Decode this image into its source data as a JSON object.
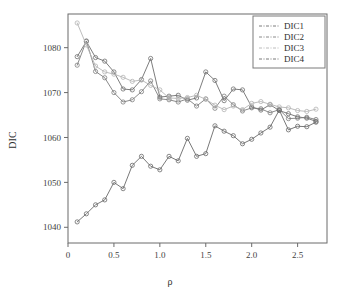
{
  "figure": {
    "background_color": "#ffffff",
    "frame_color": "#6b6b6b"
  },
  "chart_data": {
    "type": "line",
    "title": "",
    "xlabel": "ρ",
    "ylabel": "DIC",
    "xlim": [
      0.0,
      2.82
    ],
    "ylim": [
      1036.5,
      1087.5
    ],
    "xticks": [
      0,
      0.5,
      1.0,
      1.5,
      2.0,
      2.5
    ],
    "xtick_labels": [
      "0",
      "0.5",
      "1.0",
      "1.5",
      "2.0",
      "2.5"
    ],
    "yticks": [
      1040,
      1050,
      1060,
      1070,
      1080
    ],
    "ytick_labels": [
      "1040",
      "1050",
      "1060",
      "1070",
      "1080"
    ],
    "grid": false,
    "legend_position": "top-right",
    "marker": "circle-open",
    "x": [
      0.1,
      0.2,
      0.3,
      0.4,
      0.5,
      0.6,
      0.7,
      0.8,
      0.9,
      1.0,
      1.1,
      1.2,
      1.3,
      1.4,
      1.5,
      1.6,
      1.7,
      1.8,
      1.9,
      2.0,
      2.1,
      2.2,
      2.3,
      2.4,
      2.5,
      2.6,
      2.7
    ],
    "series": [
      {
        "name": "DIC1",
        "color": "#6e6e6e",
        "values": [
          1078.0,
          1081.4,
          1077.8,
          1077.0,
          1074.6,
          1070.8,
          1070.6,
          1072.9,
          1077.6,
          1069.0,
          1069.2,
          1069.4,
          1068.3,
          1068.8,
          1074.6,
          1072.7,
          1068.2,
          1070.8,
          1070.6,
          1066.8,
          1066.1,
          1067.3,
          1066.0,
          1065.3,
          1064.6,
          1064.3,
          1063.6
        ]
      },
      {
        "name": "DIC2",
        "color": "#7d7d7d",
        "values": [
          1076.1,
          1081.5,
          1074.7,
          1073.3,
          1070.0,
          1067.9,
          1068.4,
          1070.2,
          1072.6,
          1068.6,
          1068.4,
          1067.9,
          1068.6,
          1067.0,
          1068.6,
          1066.5,
          1069.2,
          1067.3,
          1065.9,
          1066.6,
          1066.4,
          1065.5,
          1066.2,
          1064.2,
          1064.3,
          1064.5,
          1064.0
        ]
      },
      {
        "name": "DIC3",
        "color": "#b4b4b4",
        "values": [
          1085.5,
          1080.6,
          1075.9,
          1074.6,
          1074.1,
          1073.4,
          1072.5,
          1072.8,
          1071.6,
          1070.6,
          1068.8,
          1068.7,
          1068.9,
          1069.4,
          1068.5,
          1067.2,
          1066.2,
          1067.0,
          1066.2,
          1067.6,
          1068.0,
          1067.4,
          1066.8,
          1066.6,
          1066.0,
          1065.8,
          1066.3
        ]
      },
      {
        "name": "DIC4",
        "color": "#6a6a6a",
        "values": [
          1041.2,
          1043.0,
          1045.0,
          1046.1,
          1050.0,
          1048.6,
          1053.8,
          1055.8,
          1053.6,
          1052.8,
          1055.8,
          1054.8,
          1059.8,
          1055.8,
          1056.4,
          1062.6,
          1061.4,
          1060.4,
          1058.6,
          1059.6,
          1061.0,
          1062.3,
          1066.1,
          1061.7,
          1062.5,
          1062.4,
          1063.4
        ]
      }
    ]
  },
  "legend": {
    "entries": [
      {
        "label": "DIC1"
      },
      {
        "label": "DIC2"
      },
      {
        "label": "DIC3"
      },
      {
        "label": "DIC4"
      }
    ]
  }
}
